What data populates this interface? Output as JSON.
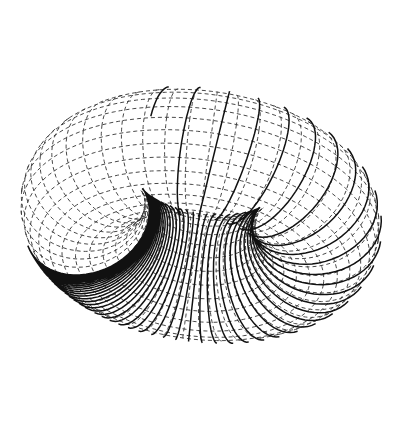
{
  "figure": {
    "colors": {
      "background": "#ffffff",
      "grid": "#333333",
      "coil": "#111111"
    }
  },
  "torus": {
    "center": [
      200,
      215
    ],
    "major_radius": 118,
    "minor_radius": 62,
    "tilt_deg": 58,
    "rotation_deg": -8,
    "toroidal_grid_lines": 48,
    "poloidal_grid_lines": 28
  },
  "coil": {
    "turns": 60,
    "phi_start_deg": 200,
    "phi_end_deg": 470,
    "compression": 2.6
  }
}
